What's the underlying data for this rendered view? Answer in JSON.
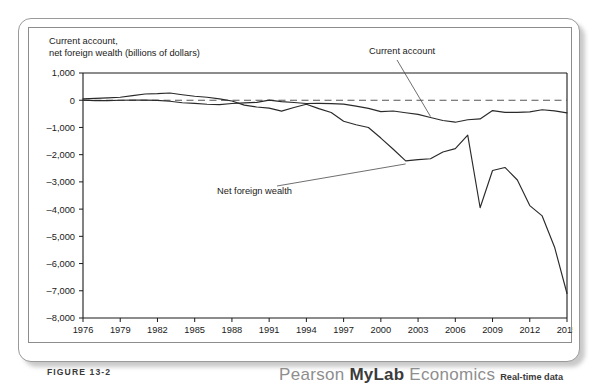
{
  "figure": {
    "caption": "FIGURE 13-2"
  },
  "brand": {
    "pearson": "Pearson",
    "mylab": "MyLab",
    "economics": "Economics",
    "realtime": "Real-time data"
  },
  "chart_data": {
    "type": "line",
    "title": "Current account,\nnet foreign wealth (billions of dollars)",
    "xlabel": "",
    "ylabel": "billions of dollars",
    "ylim": [
      -8000,
      1000
    ],
    "xlim": [
      1976,
      2015
    ],
    "ytick_labels": [
      "1,000",
      "0",
      "–1,000",
      "–2,000",
      "–3,000",
      "–4,000",
      "–5,000",
      "–6,000",
      "–7,000",
      "–8,000"
    ],
    "ytick_values": [
      1000,
      0,
      -1000,
      -2000,
      -3000,
      -4000,
      -5000,
      -6000,
      -7000,
      -8000
    ],
    "xtick_labels": [
      "1976",
      "1979",
      "1982",
      "1985",
      "1988",
      "1991",
      "1994",
      "1997",
      "2000",
      "2003",
      "2006",
      "2009",
      "2012",
      "2015"
    ],
    "xtick_values": [
      1976,
      1979,
      1982,
      1985,
      1988,
      1991,
      1994,
      1997,
      2000,
      2003,
      2006,
      2009,
      2012,
      2015
    ],
    "grid": false,
    "zero_reference_line": true,
    "legend_position": "inline-annotations",
    "x": [
      1976,
      1977,
      1978,
      1979,
      1980,
      1981,
      1982,
      1983,
      1984,
      1985,
      1986,
      1987,
      1988,
      1989,
      1990,
      1991,
      1992,
      1993,
      1994,
      1995,
      1996,
      1997,
      1998,
      1999,
      2000,
      2001,
      2002,
      2003,
      2004,
      2005,
      2006,
      2007,
      2008,
      2009,
      2010,
      2011,
      2012,
      2013,
      2014,
      2015
    ],
    "series": [
      {
        "name": "Current account",
        "annotation": "Current account",
        "values": [
          5,
          -15,
          -15,
          -1,
          2,
          5,
          -5,
          -38,
          -94,
          -118,
          -147,
          -161,
          -121,
          -99,
          -79,
          3,
          -50,
          -85,
          -122,
          -114,
          -125,
          -141,
          -215,
          -301,
          -417,
          -397,
          -459,
          -521,
          -634,
          -745,
          -807,
          -719,
          -687,
          -381,
          -444,
          -446,
          -426,
          -349,
          -392,
          -463
        ]
      },
      {
        "name": "Net foreign wealth",
        "annotation": "Net foreign wealth",
        "values": [
          50,
          70,
          85,
          110,
          170,
          230,
          240,
          265,
          200,
          145,
          110,
          50,
          -30,
          -180,
          -250,
          -290,
          -400,
          -270,
          -150,
          -310,
          -450,
          -770,
          -900,
          -1000,
          -1390,
          -1800,
          -2230,
          -2180,
          -2150,
          -1900,
          -1780,
          -1280,
          -3950,
          -2580,
          -2470,
          -2930,
          -3870,
          -4250,
          -5400,
          -7100
        ]
      }
    ],
    "annotations": [
      {
        "text": "Current account",
        "series": "Current account",
        "point_year": 2004
      },
      {
        "text": "Net foreign wealth",
        "series": "Net foreign wealth",
        "point_year": 2002
      }
    ]
  }
}
